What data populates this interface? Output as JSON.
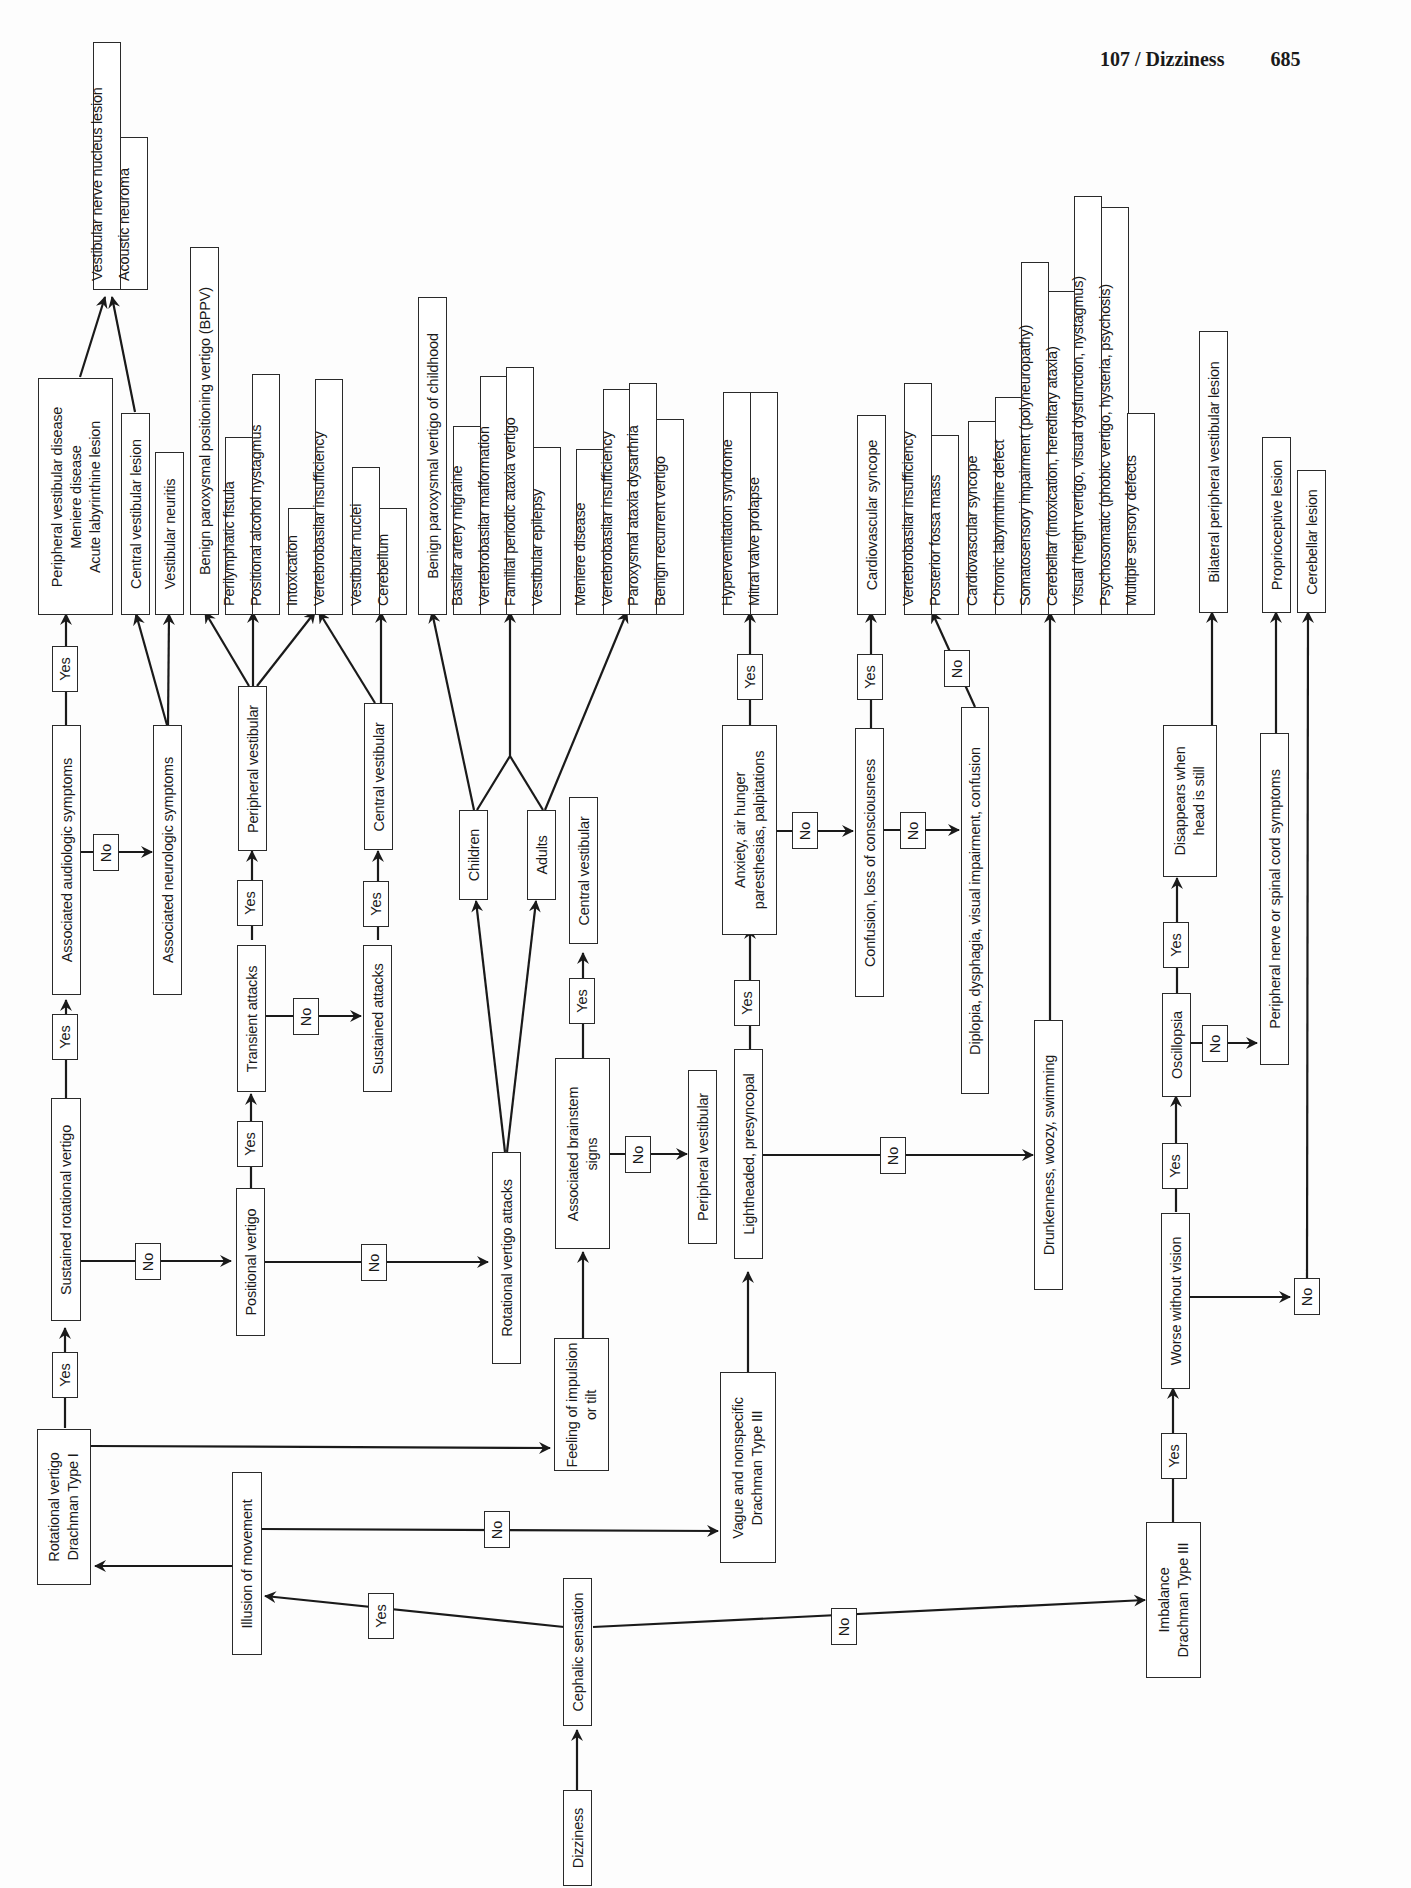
{
  "header": {
    "chapter": "107 / Dizziness",
    "page": "685"
  },
  "nodes": {
    "dizziness": "Dizziness",
    "cephalic": "Cephalic sensation",
    "illusion": "Illusion of movement",
    "rotational_type1": "Rotational vertigo\nDrachman Type I",
    "vague": "Vague and nonspecific\nDrachman Type III",
    "feeling": "Feeling of impulsion\nor tilt",
    "imbalance": "Imbalance\nDrachman Type III",
    "sustained_rot": "Sustained rotational vertigo",
    "assoc_audio": "Associated audiologic symptoms",
    "assoc_neuro": "Associated neurologic symptoms",
    "positional": "Positional vertigo",
    "transient": "Transient attacks",
    "sustained_att": "Sustained attacks",
    "periph_vest_1": "Peripheral vestibular",
    "central_vest_1": "Central vestibular",
    "rot_attacks": "Rotational vertigo attacks",
    "children": "Children",
    "adults": "Adults",
    "assoc_brainstem": "Associated brainstem\nsigns",
    "central_vest_2": "Central vestibular",
    "periph_vest_2": "Peripheral vestibular",
    "lightheaded": "Lightheaded, presyncopal",
    "anxiety": "Anxiety, air hunger\nparesthesias, palpitations",
    "confusion": "Confusion, loss of consciousness",
    "diplopia": "Diplopia, dysphagia, visual impairment, confusion",
    "drunkenness": "Drunkenness, woozy, swimming",
    "worse_no_vision": "Worse without vision",
    "oscillopsia": "Oscillopsia",
    "disappears": "Disappears when\nhead is still",
    "periph_nerve": "Peripheral nerve or spinal cord symptoms"
  },
  "outcomes": {
    "peripheral_disease": "Peripheral vestibular disease\nMeniere disease\nAcute labyrinthine lesion",
    "vest_nerve_group": [
      "Vestibular nerve nucleus lesion",
      "Acoustic neuroma"
    ],
    "central_vest_lesion": "Central vestibular lesion",
    "vest_neuritis": "Vestibular neuritis",
    "bppv": "Benign paroxysmal positioning vertigo (BPPV)",
    "perilymph_group": [
      "Perilymphatic fistula",
      "Positional alcohol nystagmus"
    ],
    "intox_group": [
      "Intoxication",
      "Vertebrobasilar insufficiency"
    ],
    "nuclei_group": [
      "Vestibular nuclei",
      "Cerebellum"
    ],
    "bpv_childhood": "Benign paroxysmal vertigo of childhood",
    "children_group": [
      "Basilar artery migraine",
      "Vertebrobasilar malformation",
      "Familial periodic ataxia vertigo",
      "Vestibular epilepsy"
    ],
    "adults_group": [
      "Meniere disease",
      "Vertebrobasilar insufficiency",
      "Paroxysmal ataxia dysarthria",
      "Benign recurrent vertigo"
    ],
    "hypervent_group": [
      "Hyperventilation syndrome",
      "Mitral valve prolapse"
    ],
    "cardio_syncope": "Cardiovascular syncope",
    "vbi_group": [
      "Vertebrobasilar insufficiency",
      "Posterior fossa mass"
    ],
    "drunk_group": [
      "Cardiovascular syncope",
      "Chronic labyrinthine defect",
      "Somatosensory impairment (polyneuropathy)",
      "Cerebellar (intoxication, hereditary ataxia)",
      "Visual (height vertigo, visual dysfunction, nystagmus)",
      "Psychosomatic (phobic vertigo, hysteria, psychosis)",
      "Multiple sensory defects"
    ],
    "bilateral": "Bilateral peripheral vestibular lesion",
    "proprioceptive": "Proprioceptive lesion",
    "cerebellar_lesion": "Cerebellar lesion"
  },
  "labels": {
    "yes": "Yes",
    "no": "No"
  }
}
